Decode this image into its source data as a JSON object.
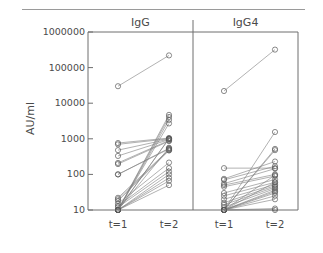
{
  "figure": {
    "ylabel": "AU/ml",
    "panels": [
      {
        "name": "IgG",
        "title": "IgG"
      },
      {
        "name": "IgG4",
        "title": "IgG4"
      }
    ],
    "y_ticks": [
      "1000000",
      "100000",
      "10000",
      "1000",
      "100",
      "10"
    ],
    "x_ticks": [
      "t=1",
      "t=2"
    ],
    "colors": {
      "axis": "#6e6e6e",
      "marker": "#595959",
      "line": "#7d7d7d",
      "text": "#4a4a4a",
      "rule": "#9a9a9a",
      "background": "#ffffff"
    }
  },
  "chart_data": {
    "type": "line",
    "title": "",
    "subtitle": "",
    "xlabel": "",
    "ylabel": "AU/ml",
    "yscale": "log",
    "ylim": [
      10,
      1000000
    ],
    "ytick_values": [
      1000000,
      100000,
      10000,
      1000,
      100,
      10
    ],
    "ytick_labels": [
      "1000000",
      "100000",
      "10000",
      "1000",
      "100",
      "10"
    ],
    "x": [
      "t=1",
      "t=2"
    ],
    "grid": false,
    "legend": false,
    "marker": "open-circle",
    "panels": [
      {
        "name": "IgG",
        "series": [
          {
            "name": "s1",
            "values": [
              30000,
              220000
            ]
          },
          {
            "name": "s2",
            "values": [
              10,
              4700
            ]
          },
          {
            "name": "s3",
            "values": [
              10,
              4100
            ]
          },
          {
            "name": "s4",
            "values": [
              10,
              3400
            ]
          },
          {
            "name": "s5",
            "values": [
              760,
              1050
            ]
          },
          {
            "name": "s6",
            "values": [
              700,
              1000
            ]
          },
          {
            "name": "s7",
            "values": [
              480,
              980
            ]
          },
          {
            "name": "s8",
            "values": [
              330,
              950
            ]
          },
          {
            "name": "s9",
            "values": [
              210,
              900
            ]
          },
          {
            "name": "s10",
            "values": [
              195,
              860
            ]
          },
          {
            "name": "s11",
            "values": [
              100,
              540
            ]
          },
          {
            "name": "s12",
            "values": [
              100,
              520
            ]
          },
          {
            "name": "s13",
            "values": [
              22,
              500
            ]
          },
          {
            "name": "s14",
            "values": [
              20,
              480
            ]
          },
          {
            "name": "s15",
            "values": [
              18,
              470
            ]
          },
          {
            "name": "s16",
            "values": [
              15,
              215
            ]
          },
          {
            "name": "s17",
            "values": [
              13,
              150
            ]
          },
          {
            "name": "s18",
            "values": [
              12,
              120
            ]
          },
          {
            "name": "s19",
            "values": [
              10,
              100
            ]
          },
          {
            "name": "s20",
            "values": [
              10,
              80
            ]
          },
          {
            "name": "s21",
            "values": [
              10,
              66
            ]
          },
          {
            "name": "s22",
            "values": [
              10,
              50
            ]
          },
          {
            "name": "s23",
            "values": [
              10,
              1020
            ]
          },
          {
            "name": "s24",
            "values": [
              10,
              2700
            ]
          },
          {
            "name": "s25",
            "values": [
              10,
              1000
            ]
          },
          {
            "name": "s26",
            "values": [
              10,
              560
            ]
          }
        ]
      },
      {
        "name": "IgG4",
        "series": [
          {
            "name": "t1",
            "values": [
              22000,
              320000
            ]
          },
          {
            "name": "t2",
            "values": [
              10,
              1550
            ]
          },
          {
            "name": "t3",
            "values": [
              10,
              520
            ]
          },
          {
            "name": "t4",
            "values": [
              10,
              480
            ]
          },
          {
            "name": "t5",
            "values": [
              150,
              150
            ]
          },
          {
            "name": "t6",
            "values": [
              75,
              230
            ]
          },
          {
            "name": "t7",
            "values": [
              70,
              170
            ]
          },
          {
            "name": "t8",
            "values": [
              55,
              145
            ]
          },
          {
            "name": "t9",
            "values": [
              50,
              100
            ]
          },
          {
            "name": "t10",
            "values": [
              45,
              90
            ]
          },
          {
            "name": "t11",
            "values": [
              30,
              72
            ]
          },
          {
            "name": "t12",
            "values": [
              25,
              60
            ]
          },
          {
            "name": "t13",
            "values": [
              20,
              52
            ]
          },
          {
            "name": "t14",
            "values": [
              16,
              48
            ]
          },
          {
            "name": "t15",
            "values": [
              14,
              44
            ]
          },
          {
            "name": "t16",
            "values": [
              12,
              40
            ]
          },
          {
            "name": "t17",
            "values": [
              10,
              36
            ]
          },
          {
            "name": "t18",
            "values": [
              10,
              33
            ]
          },
          {
            "name": "t19",
            "values": [
              10,
              30
            ]
          },
          {
            "name": "t20",
            "values": [
              10,
              25
            ]
          },
          {
            "name": "t21",
            "values": [
              10,
              20
            ]
          },
          {
            "name": "t22",
            "values": [
              10,
              10
            ]
          },
          {
            "name": "t23",
            "values": [
              10,
              11
            ]
          },
          {
            "name": "t24",
            "values": [
              10,
              95
            ]
          },
          {
            "name": "t25",
            "values": [
              10,
              60
            ]
          }
        ]
      }
    ]
  }
}
